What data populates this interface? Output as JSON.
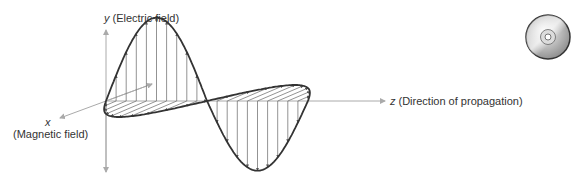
{
  "axes": {
    "y": {
      "var": "y",
      "label": "(Electric field)"
    },
    "x": {
      "var": "x",
      "label": "(Magnetic field)"
    },
    "z": {
      "var": "z",
      "label": "(Direction of propagation)"
    }
  },
  "waves": {
    "electric": {
      "plane": "y-z",
      "cycles": 1,
      "color": "#333333"
    },
    "magnetic": {
      "plane": "x-z",
      "cycles": 1,
      "color": "#333333"
    }
  },
  "icon": {
    "name": "cd-disc-icon"
  },
  "colors": {
    "axis": "#aaaaaa",
    "curve": "#333333",
    "vector": "#777777",
    "text": "#333333"
  }
}
